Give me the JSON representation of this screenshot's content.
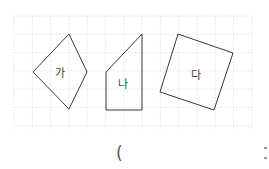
{
  "grid": {
    "x0": 14,
    "y0": 16,
    "x1": 252,
    "y1": 129,
    "spacing": 18.3,
    "line_color": "#ececec"
  },
  "shapes": [
    {
      "name": "ga",
      "label": "가",
      "points": "69,34 87,72 69,109 33,72",
      "label_x": 60,
      "label_y": 77
    },
    {
      "name": "na",
      "label": "나",
      "points": "142,34 142,110 106,110 106,72",
      "label_x": 123,
      "label_y": 88
    },
    {
      "name": "da",
      "label": "다",
      "points": "178,34 233,53 214,110 160,92",
      "label_x": 196,
      "label_y": 79
    }
  ],
  "stroke_color": "#3a3a3a",
  "answer": {
    "open_paren": "("
  }
}
